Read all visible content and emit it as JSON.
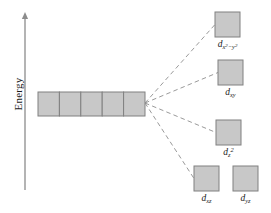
{
  "figure": {
    "type": "crystal-field-splitting-diagram",
    "axis": {
      "label": "Energy",
      "direction": "up",
      "line_color": "#8c8c8c",
      "x": 25,
      "y_top": 12,
      "y_bottom": 190
    },
    "style": {
      "box_fill": "#c8c8c8",
      "box_stroke": "#808080",
      "dash_color": "#9a9a9a",
      "text_color": "#1a1a1a",
      "background": "#ffffff"
    },
    "degenerate_set": {
      "name": "degenerate-d-orbitals",
      "count": 5,
      "x": 38,
      "y": 92,
      "box_w": 21.4,
      "box_h": 24
    },
    "convergence_point": {
      "x": 145,
      "y": 103
    },
    "levels": [
      {
        "id": "dx2-y2",
        "label_html": "d<span class=\"sub-grp\">x<sup>2</sup>−y<sup>2</sup></span>",
        "label_text": "dx2-y2",
        "box": {
          "x": 215,
          "y": 12,
          "w": 25,
          "h": 25
        },
        "label_pos": {
          "x": 227.5,
          "y": 40
        },
        "connected": true
      },
      {
        "id": "dxy",
        "label_html": "d<sub>xy</sub>",
        "label_text": "dxy",
        "box": {
          "x": 218,
          "y": 60,
          "w": 25,
          "h": 25
        },
        "label_pos": {
          "x": 230.5,
          "y": 88
        },
        "connected": true
      },
      {
        "id": "dz2",
        "label_html": "d<sub>z</sub><sup>2</sup>",
        "label_text": "dz2",
        "box": {
          "x": 216,
          "y": 120,
          "w": 25,
          "h": 25
        },
        "label_pos": {
          "x": 228.5,
          "y": 148
        },
        "connected": true
      },
      {
        "id": "dxz",
        "label_html": "d<sub>xz</sub>",
        "label_text": "dxz",
        "box": {
          "x": 194,
          "y": 166,
          "w": 25,
          "h": 25
        },
        "label_pos": {
          "x": 206.5,
          "y": 194
        },
        "connected": true
      },
      {
        "id": "dyz",
        "label_html": "d<sub>yz</sub>",
        "label_text": "dyz",
        "box": {
          "x": 233,
          "y": 166,
          "w": 25,
          "h": 25
        },
        "label_pos": {
          "x": 245.5,
          "y": 194
        },
        "connected": false
      }
    ]
  },
  "chart_data": {
    "type": "diagram",
    "title": "",
    "ylabel": "Energy",
    "left_group": {
      "label": "degenerate d orbitals",
      "orbital_count": 5,
      "relative_energy": 0.52
    },
    "split_levels": [
      {
        "label": "dx2-y2",
        "relative_energy": 1.0,
        "orbital_count": 1
      },
      {
        "label": "dxy",
        "relative_energy": 0.77,
        "orbital_count": 1
      },
      {
        "label": "dz2",
        "relative_energy": 0.48,
        "orbital_count": 1
      },
      {
        "label": "dxz",
        "relative_energy": 0.26,
        "orbital_count": 1
      },
      {
        "label": "dyz",
        "relative_energy": 0.26,
        "orbital_count": 1
      }
    ]
  }
}
